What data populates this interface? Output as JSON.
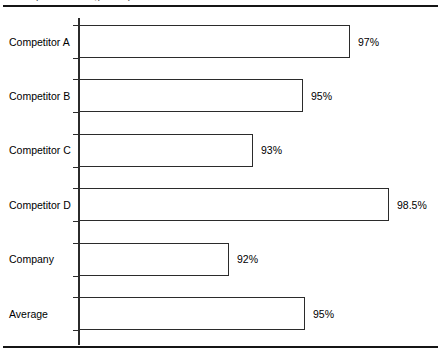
{
  "figure": {
    "clipped_title_fragment": "parison of regulatory"
  },
  "chart_data": {
    "type": "bar",
    "orientation": "horizontal",
    "title": "",
    "xlabel": "",
    "ylabel": "",
    "grid": false,
    "legend": false,
    "value_suffix": "%",
    "xlim": [
      91,
      99.5
    ],
    "categories": [
      "Competitor A",
      "Competitor B",
      "Competitor C",
      "Competitor D",
      "Company",
      "Average"
    ],
    "values": [
      97,
      95,
      93,
      98.5,
      92,
      95
    ],
    "labels": [
      "97%",
      "95%",
      "93%",
      "98.5%",
      "92%",
      "95%"
    ],
    "bar_pixel_widths": [
      271,
      224,
      174,
      310,
      150,
      226
    ],
    "colors": {
      "bar_fill": "#ffffff",
      "bar_stroke": "#2b2b2b",
      "axis": "#2b2b2b",
      "rule": "#151515",
      "text": "#000000"
    }
  }
}
